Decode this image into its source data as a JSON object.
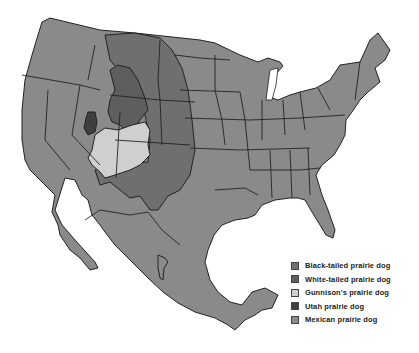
{
  "map": {
    "title": "",
    "subject": "Prairie dog species ranges in North America",
    "colors": {
      "background": "#ffffff",
      "base_land": "#8a8a8a",
      "black_tailed": "#6f6f6f",
      "white_tailed": "#5e5e5e",
      "gunnison": "#cfcfcf",
      "utah": "#3f3f3f",
      "mexican": "#8a8a8a",
      "border": "#222222"
    }
  },
  "legend": {
    "items": [
      {
        "label": "Black-tailed prairie dog",
        "color": "#6f6f6f"
      },
      {
        "label": "White-tailed prairie dog",
        "color": "#5e5e5e"
      },
      {
        "label": "Gunnison's prairie dog",
        "color": "#cfcfcf"
      },
      {
        "label": "Utah prairie dog",
        "color": "#3f3f3f"
      },
      {
        "label": "Mexican prairie dog",
        "color": "#8a8a8a"
      }
    ]
  }
}
